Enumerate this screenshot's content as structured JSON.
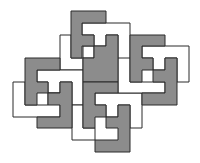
{
  "diagram": {
    "colors": {
      "grey": "#8c8c8c",
      "white": "#ffffff",
      "stroke": "#2a2a2a"
    },
    "pieces": [
      {
        "id": "white-top",
        "fill": "white",
        "points": "82,23 130,23 130,82 118,82 118,35 106,35 106,46 94,46 94,35 82,35"
      },
      {
        "id": "white-left-top",
        "fill": "white",
        "points": "60,35 71,35 71,58 83,58 83,46 94,46 94,58 83,58 83,70 60,70"
      },
      {
        "id": "white-left-mid",
        "fill": "white",
        "points": "37,70 83,70 83,105 72,105 72,82 60,82 60,93 48,93 48,82 37,82"
      },
      {
        "id": "white-left",
        "fill": "white",
        "points": "13,82 25,82 25,105 48,105 48,93 60,93 60,117 13,117"
      },
      {
        "id": "white-bottom",
        "fill": "white",
        "points": "72,105 83,105 83,128 95,128 95,140 72,140"
      },
      {
        "id": "white-center-right",
        "fill": "white",
        "points": "95,93 142,93 142,128 130,128 130,105 118,105 118,117 106,117 106,105 95,105"
      },
      {
        "id": "white-center",
        "fill": "white",
        "points": "118,58 130,58 130,82 165,82 165,93 118,93"
      },
      {
        "id": "white-right",
        "fill": "white",
        "points": "142,46 189,46 189,82 177,82 177,58 165,58 165,70 153,70 153,58 142,58"
      },
      {
        "id": "grey-top",
        "fill": "grey",
        "points": "71,11 106,11 106,23 82,23 82,35 94,35 94,46 82,46 82,58 71,58"
      },
      {
        "id": "grey-center-upper",
        "fill": "grey",
        "points": "106,35 118,35 118,82 83,82 83,58 94,58 94,46 106,46"
      },
      {
        "id": "grey-center-lower",
        "fill": "grey",
        "points": "83,82 118,82 118,93 95,93 95,105 106,105 106,117 95,117 95,128 83,128"
      },
      {
        "id": "grey-bottom",
        "fill": "grey",
        "points": "118,105 130,105 130,152 95,152 95,140 118,140 118,128 106,128 106,117 118,117"
      },
      {
        "id": "grey-right-upper",
        "fill": "grey",
        "points": "130,35 165,35 165,46 142,46 142,58 153,58 153,70 142,70 142,82 130,82"
      },
      {
        "id": "grey-right-lower",
        "fill": "grey",
        "points": "165,58 177,58 177,105 142,105 142,93 165,93 165,82 153,82 153,70 165,70"
      },
      {
        "id": "grey-left-upper",
        "fill": "grey",
        "points": "25,58 60,58 60,70 37,70 37,82 48,82 48,93 37,93 37,105 25,105"
      },
      {
        "id": "grey-left-lower",
        "fill": "grey",
        "points": "60,82 72,82 72,128 37,128 37,117 60,117 60,105 48,105 48,93 60,93"
      }
    ]
  }
}
